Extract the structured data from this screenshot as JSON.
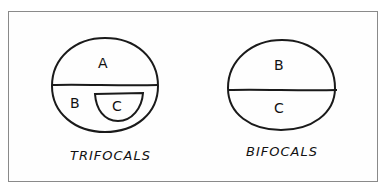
{
  "figure": {
    "stroke_color": "#1a1a1a",
    "frame_color": "#8a8a8a",
    "background": "#ffffff"
  },
  "trifocals": {
    "caption": "TRIFOCALS",
    "zones": {
      "top": "A",
      "middle": "B",
      "inset": "C"
    }
  },
  "bifocals": {
    "caption": "BIFOCALS",
    "zones": {
      "top": "B",
      "bottom": "C"
    }
  }
}
